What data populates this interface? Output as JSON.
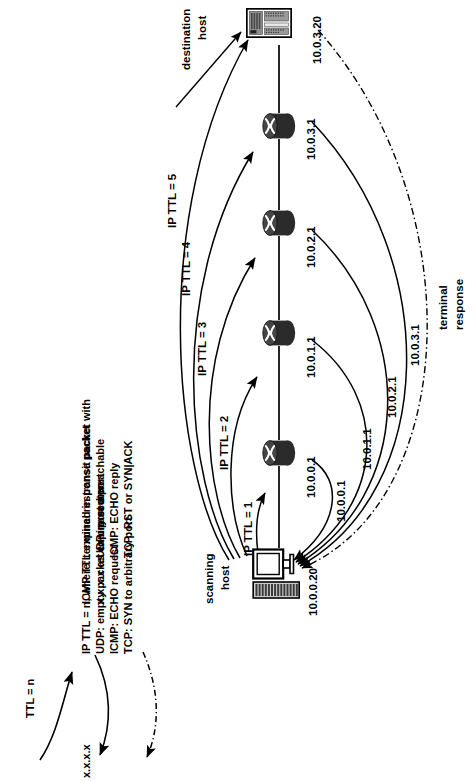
{
  "diagram": {
    "orientation": "rotated-90-ccw",
    "bg": "#ffffff",
    "ink": "#000000"
  },
  "topology": {
    "scanning_host": {
      "label": "scanning\nhost",
      "label_line1": "scanning",
      "label_line2": "host",
      "ip": "10.0.0.20",
      "icon": "desktop-computer-icon"
    },
    "destination_host": {
      "label_line1": "destination",
      "label_line2": "host",
      "ip": "10.0.3.20",
      "icon": "server-icon"
    },
    "routers": [
      {
        "ip": "10.0.0.1",
        "icon": "router-icon"
      },
      {
        "ip": "10.0.1.1",
        "icon": "router-icon"
      },
      {
        "ip": "10.0.2.1",
        "icon": "router-icon"
      },
      {
        "ip": "10.0.3.1",
        "icon": "router-icon"
      }
    ]
  },
  "probes": [
    {
      "label": "IP TTL = 1"
    },
    {
      "label": "IP TTL = 2"
    },
    {
      "label": "IP TTL = 3"
    },
    {
      "label": "IP TTL = 4"
    },
    {
      "label": "IP TTL = 5"
    }
  ],
  "responses": [
    {
      "label": "10.0.0.1"
    },
    {
      "label": "10.0.1.1"
    },
    {
      "label": "10.0.2.1"
    },
    {
      "label": "10.0.3.1"
    }
  ],
  "terminal_response": {
    "line1": "terminal",
    "line2": "response"
  },
  "legend": {
    "probe": {
      "arrow_label": "TTL = n",
      "lines": [
        "IP TTL = n, where:",
        "UDP: empty packet to unused port",
        "ICMP: ECHO request",
        "TCP: SYN to arbitrary port"
      ]
    },
    "expiry": {
      "arrow_label": "x.x.x.x",
      "lines": [
        "ICMP TTL expired in transit packet with",
        "x.x.x.x as expiry router"
      ]
    },
    "terminal": {
      "arrow_label": "",
      "lines": [
        "terminal response packet",
        "UDP: port unreachable",
        "ICMP: ECHO reply",
        "TCP: RST or SYN|ACK"
      ]
    }
  }
}
